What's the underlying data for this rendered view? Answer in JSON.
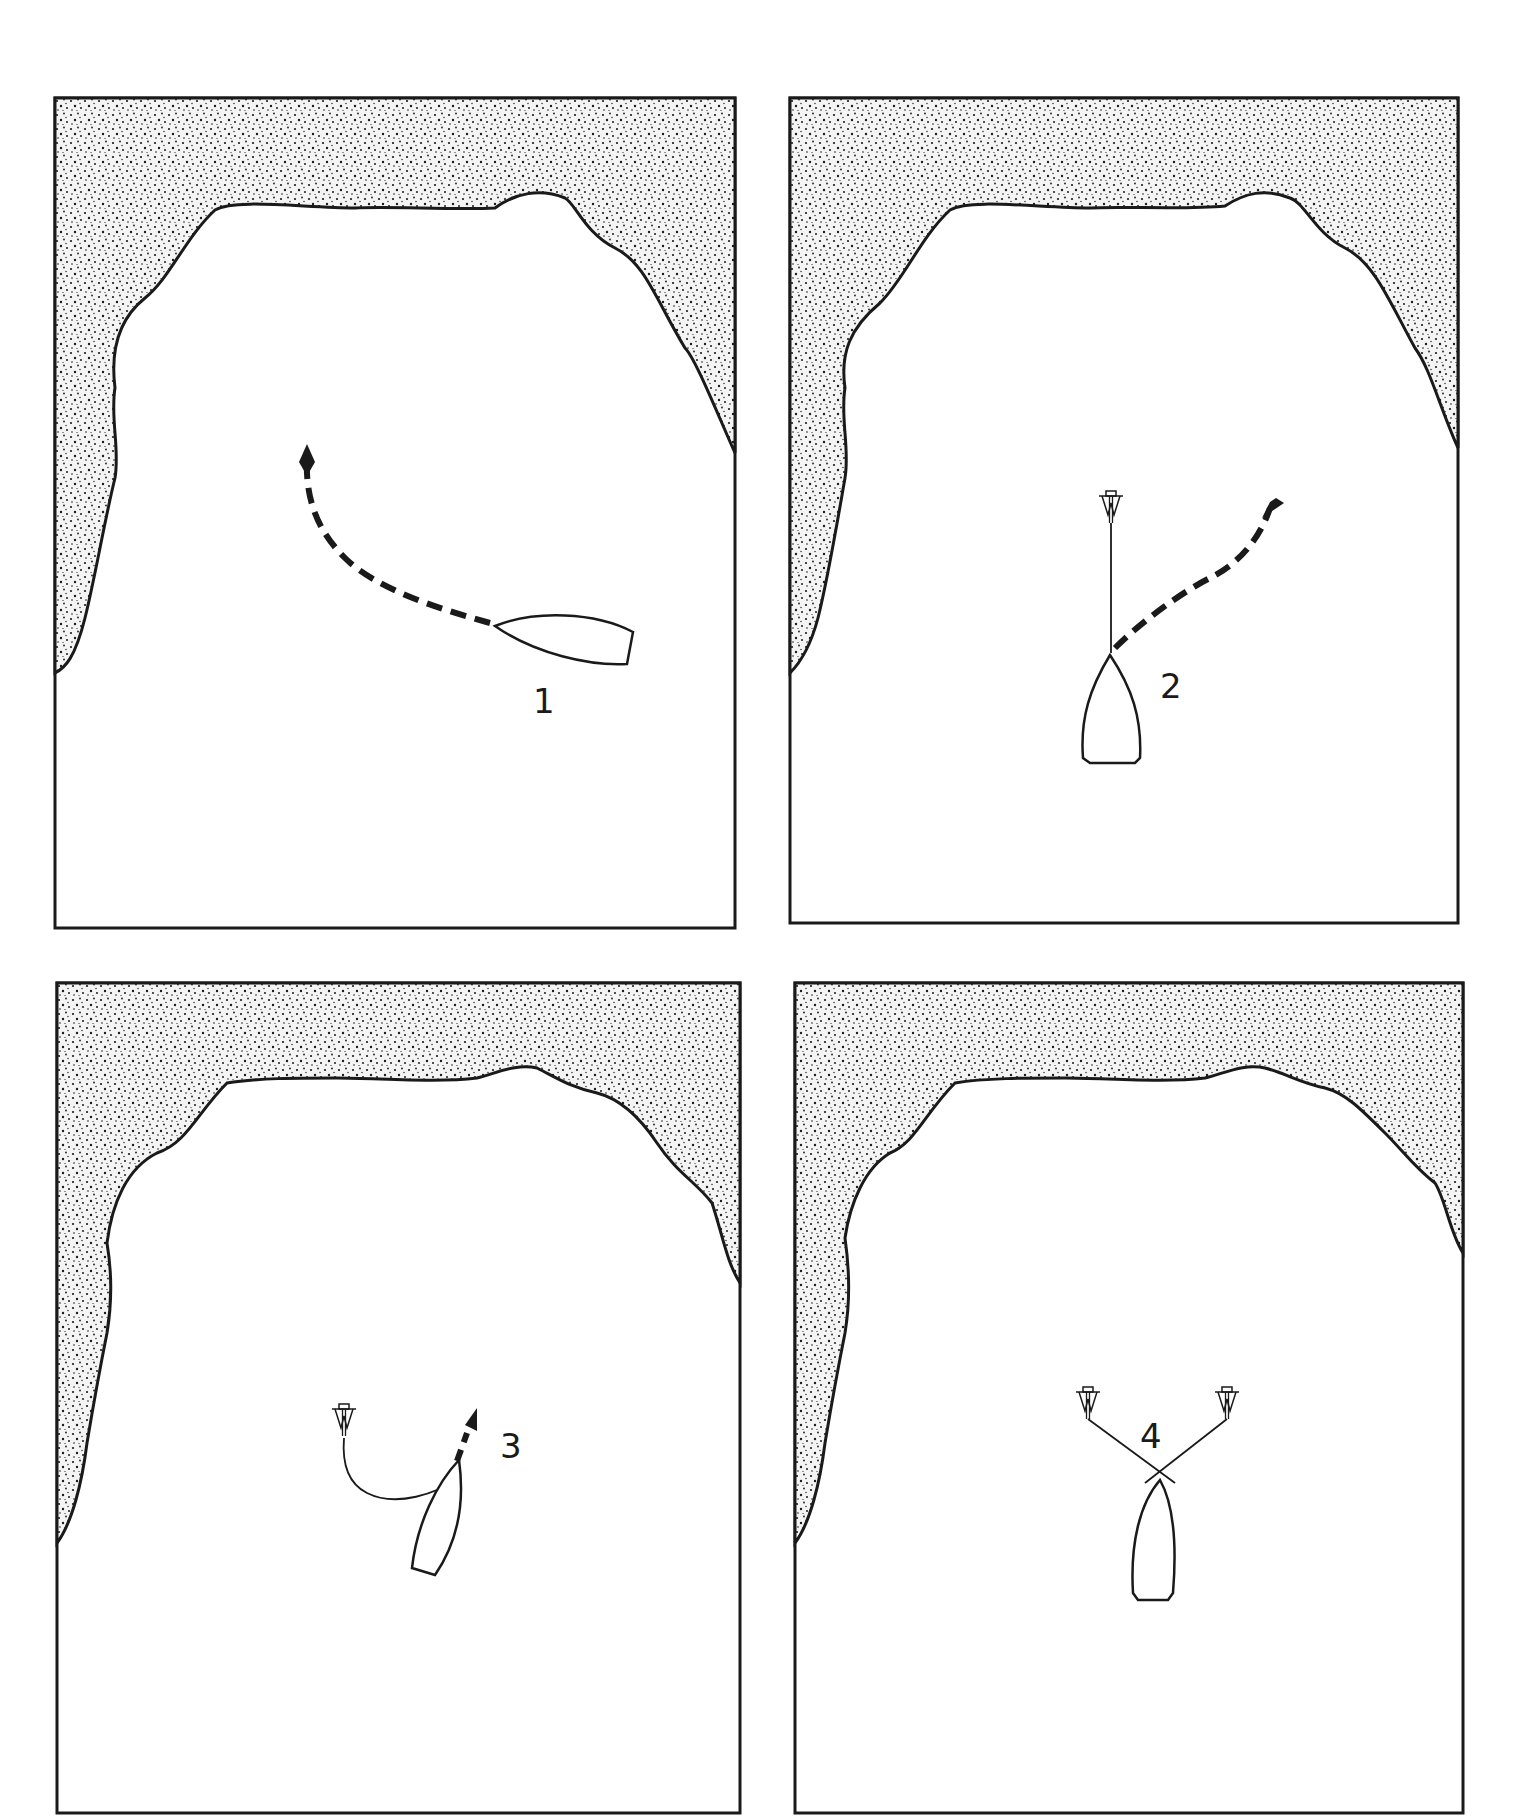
{
  "figure": {
    "colors": {
      "ink": "#1a1a1a",
      "water": "#ffffff",
      "land": "#e9e9e9"
    }
  },
  "panels": [
    {
      "step": "1",
      "label": "1",
      "anchors": 0,
      "boat": "approaching bay, heading left, dashed course curving up-left"
    },
    {
      "step": "2",
      "label": "2",
      "anchors": 1,
      "boat": "first anchor set ahead, dashed course curving up-right"
    },
    {
      "step": "3",
      "label": "3",
      "anchors": 1,
      "boat": "anchor line slack, boat motoring up-right to drop second anchor"
    },
    {
      "step": "4",
      "label": "4",
      "anchors": 2,
      "boat": "boat moored on two anchors with crossed lines"
    }
  ]
}
